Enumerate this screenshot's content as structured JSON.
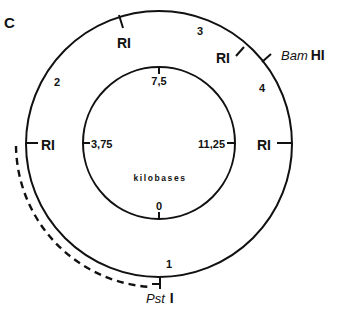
{
  "panel_label": "C",
  "outer_ring": {
    "sites": [
      {
        "name": "RI",
        "label": "RI"
      },
      {
        "name": "RI",
        "label": "RI"
      },
      {
        "name": "BamHI",
        "label_italic": "Bam",
        "label_roman": "HI"
      },
      {
        "name": "RI",
        "label": "RI"
      },
      {
        "name": "RI",
        "label": "RI"
      },
      {
        "name": "PstI",
        "label_italic": "Pst",
        "label_roman": "I"
      }
    ],
    "fragments": [
      "1",
      "2",
      "3",
      "4"
    ]
  },
  "inner_ring": {
    "unit_label": "kilobases",
    "ticks": [
      "0",
      "3,75",
      "7,5",
      "11,25"
    ]
  },
  "colors": {
    "ink": "#111111",
    "background": "#ffffff"
  }
}
